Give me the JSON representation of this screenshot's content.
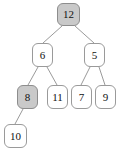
{
  "figure": {
    "type": "binary-tree-diagram",
    "width": 119,
    "height": 153,
    "background_color": "#ffffff",
    "node_fill_default": "#ffffff",
    "node_fill_shaded": "#c9c9c9",
    "node_border_color": "#9a9a9a",
    "edge_color": "#9a9a9a",
    "text_color": "#111111"
  },
  "nodes": [
    {
      "id": "n12",
      "label": "12",
      "shaded": true,
      "x": 57,
      "y": 3,
      "w": 23,
      "h": 23,
      "level": 0
    },
    {
      "id": "n6",
      "label": "6",
      "shaded": false,
      "x": 32,
      "y": 43,
      "w": 21,
      "h": 24,
      "level": 1
    },
    {
      "id": "n5",
      "label": "5",
      "shaded": false,
      "x": 84,
      "y": 43,
      "w": 21,
      "h": 24,
      "level": 1
    },
    {
      "id": "n8",
      "label": "8",
      "shaded": true,
      "x": 17,
      "y": 85,
      "w": 21,
      "h": 24,
      "level": 2
    },
    {
      "id": "n11",
      "label": "11",
      "shaded": false,
      "x": 47,
      "y": 85,
      "w": 21,
      "h": 24,
      "level": 2
    },
    {
      "id": "n7",
      "label": "7",
      "shaded": false,
      "x": 71,
      "y": 85,
      "w": 21,
      "h": 24,
      "level": 2
    },
    {
      "id": "n9",
      "label": "9",
      "shaded": false,
      "x": 95,
      "y": 85,
      "w": 21,
      "h": 24,
      "level": 2
    },
    {
      "id": "n10",
      "label": "10",
      "shaded": false,
      "x": 4,
      "y": 124,
      "w": 23,
      "h": 24,
      "level": 3
    }
  ],
  "edges": [
    {
      "from": "n12",
      "to": "n6",
      "x1": 62,
      "y1": 26,
      "x2": 43,
      "y2": 43
    },
    {
      "from": "n12",
      "to": "n5",
      "x1": 75,
      "y1": 26,
      "x2": 94,
      "y2": 43
    },
    {
      "from": "n6",
      "to": "n8",
      "x1": 38,
      "y1": 67,
      "x2": 28,
      "y2": 85
    },
    {
      "from": "n6",
      "to": "n11",
      "x1": 47,
      "y1": 67,
      "x2": 57,
      "y2": 85
    },
    {
      "from": "n5",
      "to": "n7",
      "x1": 90,
      "y1": 67,
      "x2": 81,
      "y2": 85
    },
    {
      "from": "n5",
      "to": "n9",
      "x1": 99,
      "y1": 67,
      "x2": 105,
      "y2": 85
    },
    {
      "from": "n8",
      "to": "n10",
      "x1": 23,
      "y1": 109,
      "x2": 15,
      "y2": 124
    }
  ]
}
